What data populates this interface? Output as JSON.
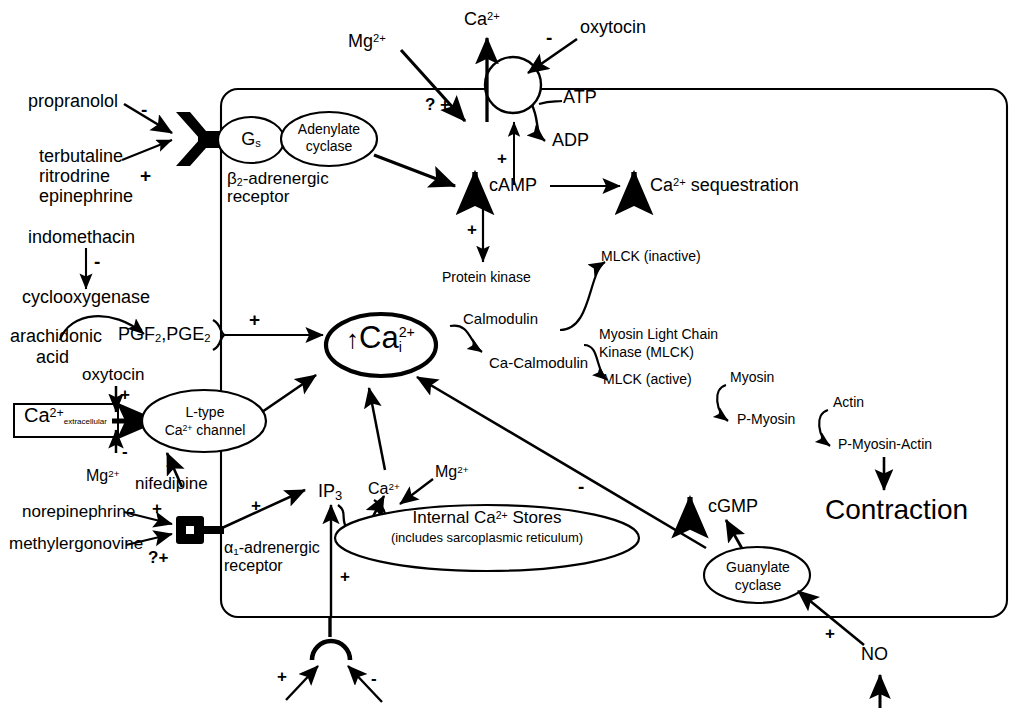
{
  "diagram": {
    "colors": {
      "ink": "#000000",
      "paper": "#ffffff"
    }
  },
  "membrane": {
    "label": "cell-membrane",
    "extracellular_label": "Ca2+ extracellular"
  },
  "beta_pathway": {
    "antagonist": "propranolol",
    "antagonist_sign": "-",
    "agonists": [
      "terbutaline",
      "ritrodrine",
      "epinephrine"
    ],
    "agonist_sign": "+",
    "receptor_line1": "β",
    "receptor_sub": "2",
    "receptor_line1b": "-adrenergic",
    "receptor_line2": "receptor",
    "g_protein": "G",
    "g_protein_sub": "s",
    "enzyme_line1": "Adenylate",
    "enzyme_line2": "cyclase"
  },
  "camp_node": {
    "label": "cAMP",
    "up_arrow": "↑",
    "sign_from_cyclase": "+",
    "sign_to_pump": "+",
    "sign_to_kinase": "+"
  },
  "pump": {
    "ion": "Ca",
    "ion_charge": "2+",
    "substrate": "ATP",
    "product": "ADP",
    "inhibitor": "oxytocin",
    "inhibitor_sign": "-",
    "mg_label": "Mg",
    "mg_charge": "2+",
    "mg_sign": "? +"
  },
  "sequestration": {
    "label": "Ca",
    "charge": "2+",
    "suffix": " sequestration",
    "up_arrow": "↑"
  },
  "protein_kinase": {
    "label": "Protein kinase"
  },
  "prostaglandin_pathway": {
    "inhibitor": "indomethacin",
    "inhibitor_sign": "-",
    "enzyme": "cyclooxygenase",
    "substrate_line1": "arachidonic",
    "substrate_line2": "acid",
    "products": "PGF",
    "products_sub1": "2",
    "products_mid": ",PGE",
    "products_sub2": "2",
    "sign_to_calcium": "+"
  },
  "l_type_channel": {
    "line1": "L-type",
    "line2a": "Ca",
    "line2_charge": "2+",
    "line2b": " channel",
    "activator": "oxytocin",
    "activator_sign": "+",
    "mg_label": "Mg",
    "mg_charge": "2+",
    "mg_sign": "-",
    "blocker": "nifedipine",
    "blocker_sign": "-",
    "extracellular_ion": "Ca",
    "extracellular_charge": "2+",
    "extracellular_sub": "extracellular"
  },
  "alpha_pathway": {
    "agonist1": "norepinephrine",
    "agonist1_sign": "+",
    "agonist2": "methylergonovine",
    "agonist2_sign": "?+",
    "receptor_a": "α",
    "receptor_sub": "1",
    "receptor_b": "-adrenergic",
    "receptor_line2": "receptor",
    "second_messenger": "IP",
    "second_messenger_sub": "3",
    "sign_to_ip3": "+",
    "sign_ip3_up": "+"
  },
  "bottom_receptor": {
    "plus_sign": "+",
    "minus_sign": "-"
  },
  "calcium_core": {
    "label": "Ca",
    "charge": "2+",
    "sub": "i",
    "up_arrow": "↑"
  },
  "internal_stores": {
    "line1a": "Internal Ca",
    "line1_charge": "2+",
    "line1b": " Stores",
    "line2": "(includes sarcoplasmic reticulum)",
    "released_ion": "Ca",
    "released_charge": "2+",
    "mg_label": "Mg",
    "mg_charge": "2+"
  },
  "calmodulin_cascade": {
    "calmodulin": "Calmodulin",
    "ca_calmodulin": "Ca-Calmodulin",
    "mlck_inactive": "MLCK (inactive)",
    "mlck_full_line1": "Myosin Light Chain",
    "mlck_full_line2": "Kinase (MLCK)",
    "mlck_active": "MLCK (active)"
  },
  "myosin_cascade": {
    "myosin": "Myosin",
    "p_myosin": "P-Myosin",
    "actin": "Actin",
    "p_myosin_actin": "P-Myosin-Actin",
    "outcome": "Contraction"
  },
  "no_pathway": {
    "cgmp": "cGMP",
    "cgmp_up_arrow": "↑",
    "enzyme_line1": "Guanylate",
    "enzyme_line2": "cyclase",
    "no": "NO",
    "no_sign": "+",
    "inhibition_sign": "-"
  }
}
